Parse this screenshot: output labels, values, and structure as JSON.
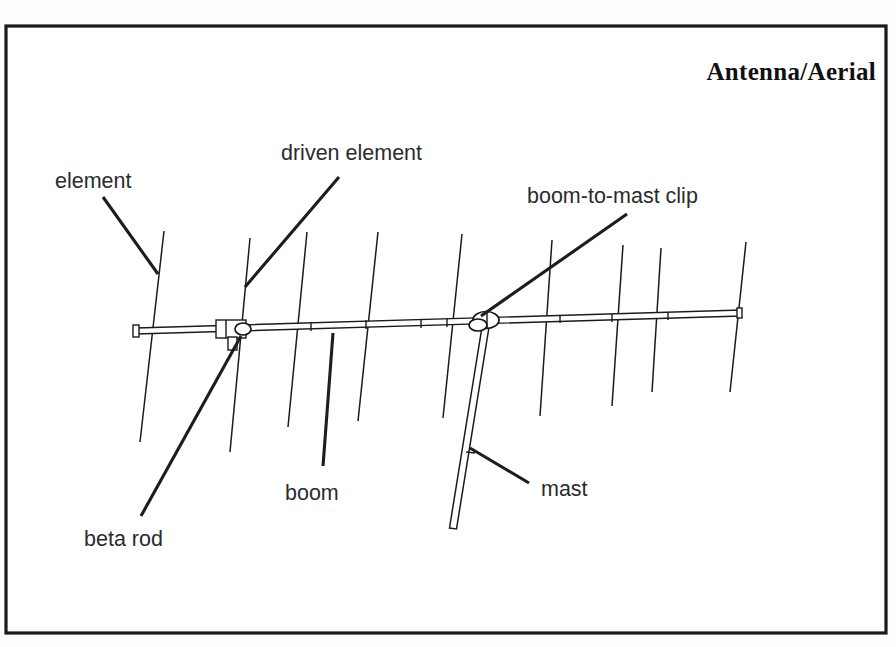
{
  "figure": {
    "title": "Antenna/Aerial",
    "background_color": "#ffffff",
    "ink_color": "#1a1a1a",
    "frame": {
      "x": 6,
      "y": 26,
      "width": 880,
      "height": 607
    }
  },
  "labels": [
    {
      "id": "element",
      "text": "element",
      "text_x": 55,
      "text_y": 188,
      "leader": {
        "x1": 103,
        "y1": 197,
        "x2": 158,
        "y2": 274
      }
    },
    {
      "id": "driven-element",
      "text": "driven element",
      "text_x": 281,
      "text_y": 160,
      "leader": {
        "x1": 339,
        "y1": 177,
        "x2": 245,
        "y2": 287
      }
    },
    {
      "id": "boom-to-mast-clip",
      "text": "boom-to-mast clip",
      "text_x": 527,
      "text_y": 203,
      "leader": {
        "x1": 627,
        "y1": 214,
        "x2": 481,
        "y2": 316
      }
    },
    {
      "id": "boom",
      "text": "boom",
      "text_x": 285,
      "text_y": 500,
      "leader": {
        "x1": 333,
        "y1": 333,
        "x2": 323,
        "y2": 466
      }
    },
    {
      "id": "beta-rod",
      "text": "beta rod",
      "text_x": 84,
      "text_y": 546,
      "leader": {
        "x1": 241,
        "y1": 336,
        "x2": 141,
        "y2": 516
      }
    },
    {
      "id": "mast",
      "text": "mast",
      "text_x": 541,
      "text_y": 496,
      "leader": {
        "x1": 529,
        "y1": 483,
        "x2": 470,
        "y2": 448
      }
    }
  ],
  "antenna": {
    "boom": {
      "left_x": 134,
      "left_y": 331,
      "right_x": 741,
      "right_y": 313,
      "thickness": 6,
      "end_cap_left": {
        "x": 134,
        "y": 325,
        "w": 7,
        "h": 12
      },
      "end_cap_right": {
        "x": 736,
        "y": 308,
        "w": 6,
        "h": 10
      },
      "joint_marks_x": [
        311,
        366,
        421,
        447,
        560,
        612,
        668
      ]
    },
    "elements": [
      {
        "id": "reflector",
        "top_x": 164,
        "top_y": 231,
        "bottom_x": 140,
        "bottom_y": 442
      },
      {
        "id": "driven",
        "top_x": 250,
        "top_y": 238,
        "bottom_x": 230,
        "bottom_y": 452
      },
      {
        "id": "director-1",
        "top_x": 307,
        "top_y": 232,
        "bottom_x": 288,
        "bottom_y": 427
      },
      {
        "id": "director-2",
        "top_x": 378,
        "top_y": 232,
        "bottom_x": 358,
        "bottom_y": 421
      },
      {
        "id": "director-3",
        "top_x": 462,
        "top_y": 234,
        "bottom_x": 443,
        "bottom_y": 418
      },
      {
        "id": "director-4",
        "top_x": 552,
        "top_y": 240,
        "bottom_x": 540,
        "bottom_y": 416
      },
      {
        "id": "director-5",
        "top_x": 623,
        "top_y": 245,
        "bottom_x": 612,
        "bottom_y": 406
      },
      {
        "id": "director-6",
        "top_x": 661,
        "top_y": 248,
        "bottom_x": 652,
        "bottom_y": 392
      },
      {
        "id": "director-7",
        "top_x": 746,
        "top_y": 242,
        "bottom_x": 730,
        "bottom_y": 392
      }
    ],
    "driven_element_feed": {
      "beta_box": {
        "x": 216,
        "y": 320,
        "width": 30,
        "height": 18
      },
      "stub": {
        "x": 228,
        "y": 337,
        "width": 9,
        "height": 13
      }
    },
    "clip": {
      "center_x": 486,
      "center_y": 320,
      "width": 26,
      "height": 17
    },
    "mast": {
      "top_x": 486,
      "top_y": 326,
      "bottom_x": 453,
      "bottom_y": 528,
      "thickness": 7,
      "joint_y": 455
    }
  }
}
